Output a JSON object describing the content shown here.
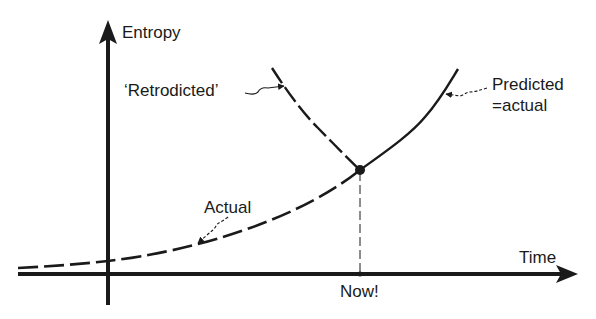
{
  "diagram": {
    "type": "entropy-vs-time-sketch",
    "axes": {
      "y_label": "Entropy",
      "x_label": "Time",
      "x_marker_label": "Now!"
    },
    "curves": [
      {
        "name": "Actual",
        "style": "dashed",
        "label": "Actual"
      },
      {
        "name": "Predicted",
        "style": "solid",
        "label_line1": "Predicted",
        "label_line2": "=actual"
      },
      {
        "name": "Retrodicted",
        "style": "dashed",
        "label": "‘Retrodicted’"
      }
    ],
    "colors": {
      "ink": "#1a1a1a",
      "background": "#ffffff"
    }
  }
}
